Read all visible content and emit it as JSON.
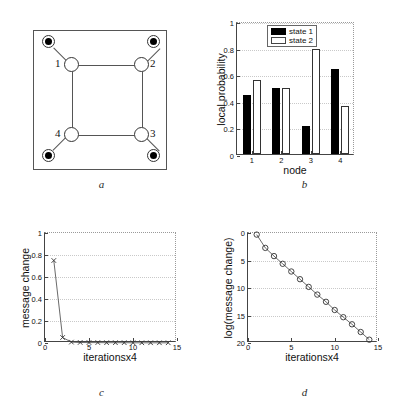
{
  "figure": {
    "panels": [
      {
        "id": "a",
        "letter": "a"
      },
      {
        "id": "b",
        "letter": "b"
      },
      {
        "id": "c",
        "letter": "c"
      },
      {
        "id": "d",
        "letter": "d"
      }
    ]
  },
  "panel_a": {
    "letter": "a",
    "description": "factor graph square lattice with observed nodes",
    "node_labels": [
      "1",
      "2",
      "3",
      "4"
    ],
    "hidden_nodes": [
      {
        "label": "1",
        "x": 30,
        "y": 26
      },
      {
        "label": "2",
        "x": 100,
        "y": 26
      },
      {
        "label": "3",
        "x": 100,
        "y": 96
      },
      {
        "label": "4",
        "x": 30,
        "y": 96
      }
    ],
    "observed_nodes": [
      {
        "x": 8,
        "y": 4
      },
      {
        "x": 122,
        "y": 4
      },
      {
        "x": 122,
        "y": 118
      },
      {
        "x": 8,
        "y": 118
      }
    ]
  },
  "panel_b": {
    "letter": "b",
    "legend": [
      {
        "label": "state 1",
        "style": "filled",
        "color": "#000000"
      },
      {
        "label": "state 2",
        "style": "open",
        "color": "#ffffff"
      }
    ]
  },
  "panel_c": {
    "letter": "c"
  },
  "panel_d": {
    "letter": "d"
  },
  "chart_data": [
    {
      "id": "b",
      "type": "bar",
      "title": "",
      "xlabel": "node",
      "ylabel": "local probability",
      "categories": [
        "1",
        "2",
        "3",
        "4"
      ],
      "xticks": [
        "1",
        "2",
        "3",
        "4"
      ],
      "yticks": [
        "0",
        "0.2",
        "0.4",
        "0.6",
        "0.8",
        "1"
      ],
      "ylim": [
        0,
        1
      ],
      "grid": true,
      "legend_position": "top-center",
      "series": [
        {
          "name": "state 1",
          "color": "#000000",
          "values": [
            0.44,
            0.5,
            0.21,
            0.64
          ]
        },
        {
          "name": "state 2",
          "color": "#ffffff",
          "values": [
            0.56,
            0.5,
            0.79,
            0.36
          ]
        }
      ]
    },
    {
      "id": "c",
      "type": "line",
      "title": "",
      "xlabel": "iterationsx4",
      "ylabel": "message change",
      "xticks": [
        "0",
        "5",
        "10",
        "15"
      ],
      "yticks": [
        "0",
        "0.2",
        "0.4",
        "0.6",
        "0.8",
        "1"
      ],
      "xlim": [
        0,
        15
      ],
      "ylim": [
        0,
        1
      ],
      "grid": true,
      "marker": "x",
      "x": [
        1,
        2,
        3,
        4,
        5,
        6,
        7,
        8,
        9,
        10,
        11,
        12,
        13,
        14
      ],
      "values": [
        0.75,
        0.05,
        0.008,
        0.005,
        0.004,
        0.004,
        0.003,
        0.003,
        0.003,
        0.002,
        0.002,
        0.002,
        0.002,
        0.002
      ]
    },
    {
      "id": "d",
      "type": "line",
      "title": "",
      "xlabel": "iterationsx4",
      "ylabel": "log(message change)",
      "xticks": [
        "0",
        "5",
        "10",
        "15"
      ],
      "yticks": [
        "0",
        "5",
        "10",
        "15",
        "20"
      ],
      "xlim": [
        0,
        15
      ],
      "ylim": [
        20,
        0
      ],
      "y_axis_inverted": true,
      "grid": true,
      "marker": "o",
      "x": [
        1,
        2,
        3,
        4,
        5,
        6,
        7,
        8,
        9,
        10,
        11,
        12,
        13,
        14
      ],
      "values": [
        0.3,
        2.7,
        4.2,
        5.6,
        7.0,
        8.4,
        9.8,
        11.2,
        12.5,
        14.0,
        15.3,
        16.6,
        18.0,
        19.4
      ]
    }
  ]
}
